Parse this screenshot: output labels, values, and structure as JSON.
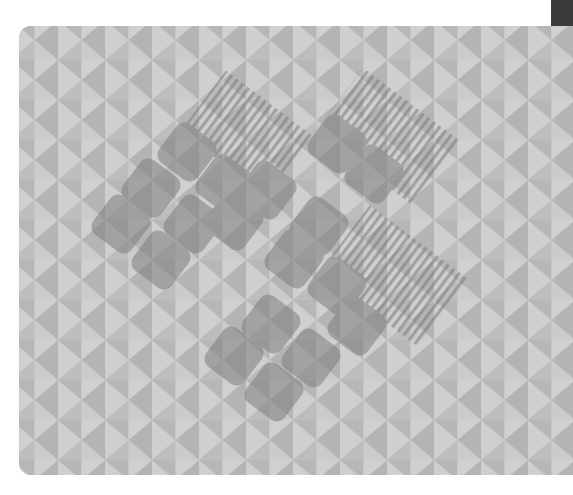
{
  "page": {
    "top_caption": "",
    "bottom_caption": ""
  },
  "card": {
    "label": "wallpaper preview",
    "pattern": "triangle tessellation",
    "motif": "rotated rounded squares with hatched panels",
    "colors": {
      "triangle_light": "#cfcfcf",
      "triangle_mid": "#bdbdbd",
      "triangle_dark": "#b2b2b2",
      "motif_fill": "#8a8a8a",
      "motif_opacity": 0.55,
      "stripe": "#7c7c7c",
      "corner_block": "#3a3a3a"
    }
  }
}
